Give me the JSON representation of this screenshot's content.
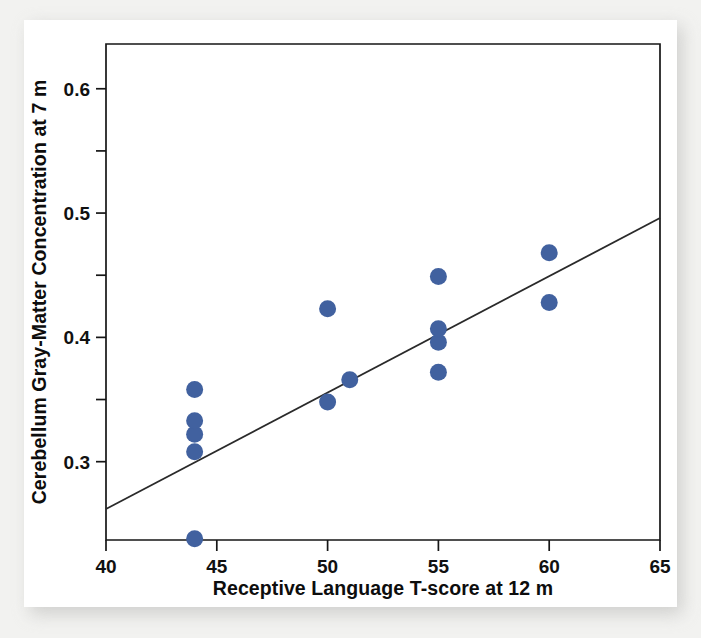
{
  "figure": {
    "background_color": "#ffffff",
    "matte_color": "#f2f2f0",
    "marker_color": "#41619f",
    "line_color": "#2a2a2a",
    "axis_color": "#161616"
  },
  "chart_data": {
    "type": "scatter",
    "title": "",
    "xlabel": "Receptive Language T-score at 12 m",
    "ylabel": "Cerebellum Gray-Matter Concentration at 7 m",
    "xlim": [
      40,
      65
    ],
    "ylim": [
      0.237,
      0.636
    ],
    "grid": false,
    "legend": "none",
    "xticks": [
      40,
      45,
      50,
      55,
      60,
      65
    ],
    "xtick_labels": [
      "40",
      "45",
      "50",
      "55",
      "60",
      "65"
    ],
    "x_minor_ticks": [],
    "yticks": [
      0.3,
      0.4,
      0.5,
      0.6
    ],
    "ytick_labels": [
      "0.3",
      "0.4",
      "0.5",
      "0.6"
    ],
    "y_minor_ticks": [
      0.35,
      0.45,
      0.55
    ],
    "points": [
      {
        "x": 44,
        "y": 0.238
      },
      {
        "x": 44,
        "y": 0.308
      },
      {
        "x": 44,
        "y": 0.322
      },
      {
        "x": 44,
        "y": 0.333
      },
      {
        "x": 44,
        "y": 0.358
      },
      {
        "x": 50,
        "y": 0.348
      },
      {
        "x": 50,
        "y": 0.423
      },
      {
        "x": 51,
        "y": 0.366
      },
      {
        "x": 55,
        "y": 0.372
      },
      {
        "x": 55,
        "y": 0.396
      },
      {
        "x": 55,
        "y": 0.407
      },
      {
        "x": 55,
        "y": 0.449
      },
      {
        "x": 60,
        "y": 0.428
      },
      {
        "x": 60,
        "y": 0.468
      }
    ],
    "marker_size": 8.5,
    "fit_line": {
      "kind": "linear-regression",
      "x": [
        40,
        65
      ],
      "y": [
        0.262,
        0.496
      ]
    }
  }
}
